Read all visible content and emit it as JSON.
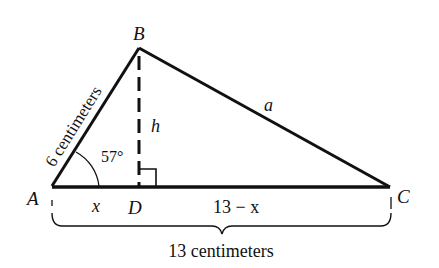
{
  "diagram": {
    "type": "triangle",
    "vertices": {
      "A": {
        "label": "A"
      },
      "B": {
        "label": "B"
      },
      "C": {
        "label": "C"
      },
      "D": {
        "label": "D"
      }
    },
    "sides": {
      "AB": "6 centimeters",
      "BC": "a",
      "BD": "h",
      "AD": "x",
      "DC": "13 − x",
      "AC_total": "13 centimeters"
    },
    "angle_A": "57°",
    "right_angle_at": "D",
    "colors": {
      "stroke": "#111111",
      "background": "#ffffff"
    }
  }
}
